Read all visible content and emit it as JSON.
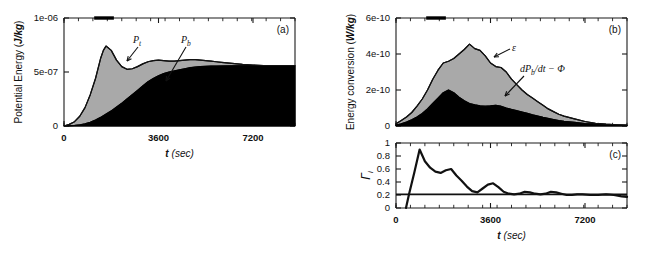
{
  "figure": {
    "width": 656,
    "height": 260,
    "background": "#ffffff",
    "fill_color_upper": "#a9a9a9",
    "fill_color_lower": "#000000",
    "line_color": "#111111"
  },
  "chart_data": [
    {
      "id": "panel-a",
      "type": "area",
      "panel_tag": "(a)",
      "title": "",
      "xlabel": "t (sec)",
      "ylabel": "Potential Energy (J/kg)",
      "xlim": [
        0,
        8800
      ],
      "ylim": [
        0,
        1e-06
      ],
      "xticks": [
        0,
        3600,
        7200
      ],
      "xticklabels": [
        "0",
        "3600",
        "7200"
      ],
      "yticks": [
        0,
        5e-07,
        1e-06
      ],
      "yticklabels": [
        "0",
        "5e-07",
        "1e-06"
      ],
      "grid": false,
      "legend": "none",
      "annotations": [
        {
          "text": "P",
          "sub": "t",
          "name": "pt-label"
        },
        {
          "text": "P",
          "sub": "b",
          "name": "pb-label"
        }
      ],
      "top_marker": {
        "x_start": 1150,
        "x_end": 1900
      },
      "x": [
        0,
        200,
        400,
        600,
        800,
        1000,
        1200,
        1400,
        1500,
        1600,
        1800,
        2000,
        2200,
        2400,
        2600,
        2800,
        3000,
        3200,
        3400,
        3600,
        3800,
        4000,
        4200,
        4400,
        4600,
        4800,
        5000,
        5200,
        5400,
        5600,
        5800,
        6000,
        6400,
        6800,
        7200,
        7600,
        8000,
        8400,
        8800
      ],
      "series": [
        {
          "name": "Pt",
          "label": "P_t",
          "values": [
            0.0,
            1.5e-08,
            4e-08,
            9e-08,
            1.7e-07,
            2.9e-07,
            4.4e-07,
            6.3e-07,
            7e-07,
            7.4e-07,
            7e-07,
            6.1e-07,
            5.5e-07,
            5.25e-07,
            5.3e-07,
            5.5e-07,
            5.75e-07,
            5.95e-07,
            6.05e-07,
            6.1e-07,
            6.05e-07,
            6e-07,
            6e-07,
            6.05e-07,
            6.1e-07,
            6.15e-07,
            6.15e-07,
            6.1e-07,
            6.05e-07,
            6e-07,
            5.95e-07,
            5.9e-07,
            5.8e-07,
            5.7e-07,
            5.65e-07,
            5.6e-07,
            5.6e-07,
            5.6e-07,
            5.6e-07
          ]
        },
        {
          "name": "Pb",
          "label": "P_b",
          "values": [
            0.0,
            2e-09,
            5e-09,
            1e-08,
            2e-08,
            3.5e-08,
            5.5e-08,
            8e-08,
            9.5e-08,
            1.1e-07,
            1.4e-07,
            1.75e-07,
            2.1e-07,
            2.5e-07,
            2.9e-07,
            3.3e-07,
            3.7e-07,
            4.1e-07,
            4.4e-07,
            4.65e-07,
            4.85e-07,
            5e-07,
            5.1e-07,
            5.2e-07,
            5.3e-07,
            5.4e-07,
            5.45e-07,
            5.5e-07,
            5.52e-07,
            5.55e-07,
            5.55e-07,
            5.56e-07,
            5.57e-07,
            5.58e-07,
            5.58e-07,
            5.58e-07,
            5.58e-07,
            5.58e-07,
            5.58e-07
          ]
        }
      ]
    },
    {
      "id": "panel-b",
      "type": "area",
      "panel_tag": "(b)",
      "title": "",
      "xlabel": "",
      "ylabel": "Energy conversion (W/kg)",
      "xlim": [
        0,
        8800
      ],
      "ylim": [
        0,
        6e-10
      ],
      "xticks": [
        0,
        3600,
        7200
      ],
      "xticklabels": [
        "",
        "",
        ""
      ],
      "yticks": [
        0,
        2e-10,
        4e-10,
        6e-10
      ],
      "yticklabels": [
        "0",
        "2e-10",
        "4e-10",
        "6e-10"
      ],
      "grid": false,
      "legend": "none",
      "annotations": [
        {
          "text": "ε",
          "sub": "",
          "name": "epsilon-label"
        },
        {
          "text": "dP",
          "sub": "b",
          "text2": "/dt − Φ",
          "name": "dpbdt-label"
        }
      ],
      "top_marker": {
        "x_start": 1150,
        "x_end": 1900
      },
      "x": [
        0,
        200,
        400,
        600,
        800,
        1000,
        1200,
        1400,
        1600,
        1800,
        2000,
        2200,
        2400,
        2600,
        2800,
        3000,
        3200,
        3400,
        3600,
        3800,
        4000,
        4200,
        4400,
        4600,
        4800,
        5000,
        5200,
        5400,
        5600,
        5800,
        6000,
        6200,
        6400,
        6800,
        7200,
        7600,
        8000,
        8400,
        8800
      ],
      "series": [
        {
          "name": "epsilon",
          "label": "ε",
          "values": [
            1.2e-11,
            3e-11,
            5e-11,
            7.5e-11,
            1.1e-10,
            1.5e-10,
            2e-10,
            2.6e-10,
            3.1e-10,
            3.5e-10,
            3.6e-10,
            3.75e-10,
            4e-10,
            4.25e-10,
            4.55e-10,
            4.3e-10,
            4.2e-10,
            3.9e-10,
            3.5e-10,
            3.3e-10,
            3.25e-10,
            3e-10,
            2.6e-10,
            2.3e-10,
            2e-10,
            1.75e-10,
            1.55e-10,
            1.35e-10,
            1.15e-10,
            9.5e-11,
            8e-11,
            6.5e-11,
            5.5e-11,
            4e-11,
            2.5e-11,
            1.5e-11,
            1e-11,
            7e-12,
            5e-12
          ]
        },
        {
          "name": "dPb_dt_minus_Phi",
          "label": "dP_b/dt − Φ",
          "values": [
            5e-12,
            1.2e-11,
            2.2e-11,
            3.5e-11,
            5e-11,
            7e-11,
            9.5e-11,
            1.25e-10,
            1.55e-10,
            1.85e-10,
            2e-10,
            1.85e-10,
            1.6e-10,
            1.4e-10,
            1.25e-10,
            1.18e-10,
            1.12e-10,
            1.1e-10,
            1.12e-10,
            1.15e-10,
            1.1e-10,
            1e-10,
            9.2e-11,
            8.5e-11,
            7.8e-11,
            7e-11,
            6.2e-11,
            5.5e-11,
            4.8e-11,
            4.2e-11,
            3.6e-11,
            3e-11,
            2.6e-11,
            2e-11,
            1.4e-11,
            1e-11,
            7e-12,
            5e-12,
            4e-12
          ]
        }
      ]
    },
    {
      "id": "panel-c",
      "type": "line",
      "panel_tag": "(c)",
      "title": "",
      "xlabel": "t (sec)",
      "ylabel": "Γ",
      "ylabel_sub": "i",
      "xlim": [
        0,
        8800
      ],
      "ylim": [
        0,
        1.0
      ],
      "xticks": [
        0,
        3600,
        7200
      ],
      "xticklabels": [
        "0",
        "3600",
        "7200"
      ],
      "yticks": [
        0,
        0.2,
        0.4,
        0.6,
        0.8,
        1
      ],
      "yticklabels": [
        "0",
        "0.2",
        "0.4",
        "0.6",
        "0.8",
        "1"
      ],
      "grid": false,
      "legend": "none",
      "reference_line": {
        "name": "gamma-threshold",
        "y": 0.21
      },
      "x": [
        380,
        500,
        700,
        900,
        1100,
        1300,
        1500,
        1700,
        1900,
        2100,
        2300,
        2500,
        2700,
        2900,
        3100,
        3300,
        3500,
        3700,
        3900,
        4100,
        4300,
        4500,
        4700,
        4900,
        5100,
        5300,
        5500,
        5700,
        5900,
        6100,
        6300,
        6500,
        6700,
        6900,
        7100,
        7400,
        7700,
        8000,
        8300,
        8600,
        8800
      ],
      "series": [
        {
          "name": "Gamma_i",
          "label": "Γ_i",
          "values": [
            0.0,
            0.22,
            0.55,
            0.9,
            0.72,
            0.62,
            0.56,
            0.54,
            0.58,
            0.6,
            0.5,
            0.42,
            0.33,
            0.26,
            0.24,
            0.3,
            0.36,
            0.38,
            0.32,
            0.25,
            0.22,
            0.21,
            0.22,
            0.25,
            0.24,
            0.22,
            0.21,
            0.22,
            0.25,
            0.24,
            0.22,
            0.2,
            0.2,
            0.21,
            0.21,
            0.2,
            0.2,
            0.21,
            0.2,
            0.18,
            0.17
          ]
        }
      ]
    }
  ]
}
